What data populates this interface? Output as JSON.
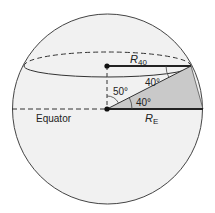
{
  "diagram": {
    "labels": {
      "r40": "R",
      "r40_sub": "40",
      "re": "R",
      "re_sub": "E",
      "equator": "Equator",
      "angle_50": "50°",
      "angle_40_upper": "40°",
      "angle_40_lower": "40°"
    },
    "colors": {
      "sphere_fill": "#f2f2f2",
      "stroke": "#333333",
      "triangle_fill": "#c8c8c8"
    }
  }
}
